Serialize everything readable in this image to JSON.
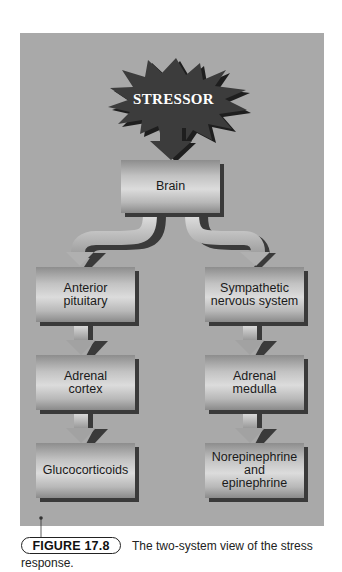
{
  "figure": {
    "stressor": "STRESSOR",
    "top_box": "Brain",
    "left_branch": [
      "Anterior\npituitary",
      "Adrenal\ncortex",
      "Glucocorticoids"
    ],
    "right_branch": [
      "Sympathetic\nnervous system",
      "Adrenal\nmedulla",
      "Norepinephrine\nand\nepinephrine"
    ],
    "colors": {
      "panel": "#a9a9a9",
      "burst": "#3c3c3c",
      "shadow": "#3a3a3a"
    }
  },
  "caption": {
    "label": "FIGURE 17.8",
    "text_line1": "The two-system view of the stress",
    "text_line2": "response."
  }
}
